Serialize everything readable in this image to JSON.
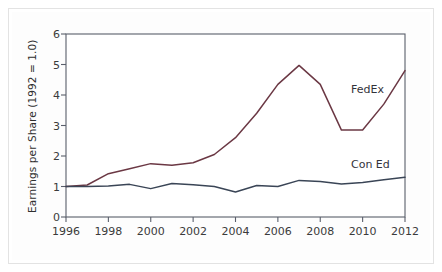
{
  "figure": {
    "background_color": "#ffffff",
    "frame_color": "#e3e3e3",
    "plot_border_color": "#5a5f6b"
  },
  "chart_data": {
    "type": "line",
    "title": "",
    "xlabel": "",
    "ylabel": "Earnings per Share (1992 = 1.0)",
    "xlim": [
      1996,
      2012
    ],
    "ylim": [
      0,
      6
    ],
    "grid": false,
    "legend_position": "inline-right",
    "xticks": [
      1996,
      1998,
      2000,
      2002,
      2004,
      2006,
      2008,
      2010,
      2012
    ],
    "xtick_labels": [
      "1996",
      "1998",
      "2000",
      "2002",
      "2004",
      "2006",
      "2008",
      "2010",
      "2012"
    ],
    "yticks": [
      0,
      1,
      2,
      3,
      4,
      5,
      6
    ],
    "ytick_labels": [
      "0",
      "1",
      "2",
      "3",
      "4",
      "5",
      "6"
    ],
    "x": [
      1996,
      1997,
      1998,
      1999,
      2000,
      2001,
      2002,
      2003,
      2004,
      2005,
      2006,
      2007,
      2008,
      2009,
      2010,
      2011,
      2012
    ],
    "series": [
      {
        "name": "FedEx",
        "color": "#6b3844",
        "values": [
          1.0,
          1.05,
          1.42,
          1.58,
          1.75,
          1.7,
          1.78,
          2.05,
          2.6,
          3.4,
          4.35,
          4.97,
          4.35,
          2.85,
          2.85,
          3.7,
          4.8
        ]
      },
      {
        "name": "Con Ed",
        "color": "#3a4556",
        "values": [
          1.0,
          1.0,
          1.02,
          1.07,
          0.93,
          1.1,
          1.06,
          1.0,
          0.82,
          1.03,
          1.0,
          1.2,
          1.16,
          1.08,
          1.13,
          1.22,
          1.3
        ]
      }
    ],
    "annotations": [
      {
        "text": "FedEx",
        "x": 2009.45,
        "y": 4.15
      },
      {
        "text": "Con Ed",
        "x": 2009.45,
        "y": 1.72
      }
    ]
  }
}
